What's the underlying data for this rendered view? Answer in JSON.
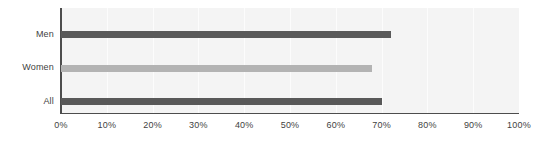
{
  "chart_data": {
    "type": "bar",
    "orientation": "horizontal",
    "title": "",
    "subtitle": "",
    "xlabel": "",
    "ylabel": "",
    "categories": [
      "Men",
      "Women",
      "All"
    ],
    "values": [
      72,
      68,
      70
    ],
    "series": [
      {
        "name": "Percentage",
        "values": [
          72,
          68,
          70
        ]
      }
    ],
    "bar_colors": [
      "#595959",
      "#b3b3b3",
      "#595959"
    ],
    "xlim": [
      0,
      100
    ],
    "xtick_labels": [
      "0%",
      "10%",
      "20%",
      "30%",
      "40%",
      "50%",
      "60%",
      "70%",
      "80%",
      "90%",
      "100%"
    ],
    "xtick_values": [
      0,
      10,
      20,
      30,
      40,
      50,
      60,
      70,
      80,
      90,
      100
    ],
    "grid": true,
    "grid_axis": "x",
    "grid_color": "#fcfcfc",
    "legend": false,
    "legend_position": "none",
    "plot_background": "#f4f4f4",
    "page_background": "#ffffff",
    "axis_color": "#4d4d4d",
    "tick_label_color": "#3f3f3f"
  }
}
